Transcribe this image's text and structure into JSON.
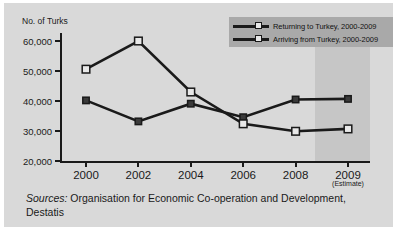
{
  "chart_data": {
    "type": "line",
    "title": "",
    "xlabel": "",
    "ylabel": "No. of Turks",
    "x": [
      "2000",
      "2002",
      "2004",
      "2006",
      "2008",
      "2009"
    ],
    "x_tick_labels": [
      "2000",
      "2002",
      "2004",
      "2006",
      "2008",
      "2009"
    ],
    "x_tick_sublabels": [
      "",
      "",
      "",
      "",
      "",
      "(Estimate)"
    ],
    "y_tick_labels": [
      "20,000",
      "30,000",
      "40,000",
      "50,000",
      "60,000"
    ],
    "y_ticks": [
      20000,
      30000,
      40000,
      50000,
      60000
    ],
    "ylim": [
      20000,
      62000
    ],
    "grid": false,
    "legend_position": "top-right",
    "series": [
      {
        "name": "Returning to Turkey, 2000-2009",
        "marker": "square-dark",
        "values": [
          40200,
          33200,
          39100,
          34600,
          40500,
          40700
        ]
      },
      {
        "name": "Arriving from Turkey, 2000-2009",
        "marker": "square-light",
        "values": [
          50600,
          60000,
          43000,
          32400,
          29900,
          30700
        ]
      }
    ],
    "annotations": [
      {
        "name": "estimate-shading",
        "label": "2009 estimate region",
        "from": "2008.5",
        "to": "2009.2"
      }
    ]
  },
  "axis": {
    "y_title": "No. of Turks",
    "y_labels": [
      "60,000",
      "50,000",
      "40,000",
      "30,000",
      "20,000"
    ],
    "x_labels": [
      {
        "label": "2000",
        "sub": ""
      },
      {
        "label": "2002",
        "sub": ""
      },
      {
        "label": "2004",
        "sub": ""
      },
      {
        "label": "2006",
        "sub": ""
      },
      {
        "label": "2008",
        "sub": ""
      },
      {
        "label": "2009",
        "sub": "(Estimate)"
      }
    ]
  },
  "legend": {
    "items": [
      {
        "label": "Returning to Turkey, 2000-2009"
      },
      {
        "label": "Arriving from Turkey, 2000-2009"
      }
    ]
  },
  "source": {
    "prefix": "Sources:",
    "text": "Organisation for Economic Co-operation and Development, Destatis"
  },
  "colors": {
    "background": "#d9d9d9",
    "page": "#ffffff",
    "line": "#1a1a1a",
    "legend_background": "#a9a9a9",
    "estimate_band": "#c6c6c6",
    "marker_light": "#e8e8e8"
  }
}
